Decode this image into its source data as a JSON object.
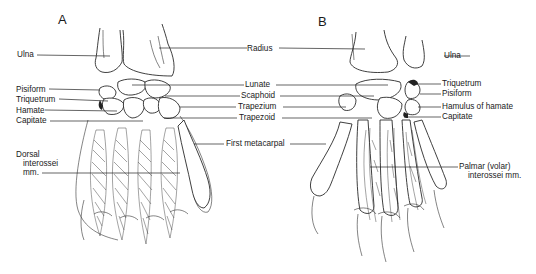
{
  "figure": {
    "panels": [
      {
        "letter": "A",
        "view": "dorsal",
        "labels_left": {
          "ulna": "Ulna",
          "pisiform": "Pisiform",
          "triquetrum": "Triquetrum",
          "hamate": "Hamate",
          "capitate": "Capitate",
          "dorsal_interossei_1": "Dorsal",
          "dorsal_interossei_2": "interossei",
          "dorsal_interossei_3": "mm."
        }
      },
      {
        "letter": "B",
        "view": "palmar",
        "labels_right": {
          "ulna": "Ulna",
          "triquetrum": "Triquetrum",
          "pisiform": "Pisiform",
          "hamulus": "Hamulus of hamate",
          "capitate": "Capitate",
          "palmar_interossei_1": "Palmar (volar)",
          "palmar_interossei_2": "interossei mm."
        }
      }
    ],
    "shared_labels": {
      "radius": "Radius",
      "lunate": "Lunate",
      "scaphoid": "Scaphoid",
      "trapezium": "Trapezium",
      "trapezoid": "Trapezoid",
      "first_metacarpal": "First metacarpal"
    }
  }
}
